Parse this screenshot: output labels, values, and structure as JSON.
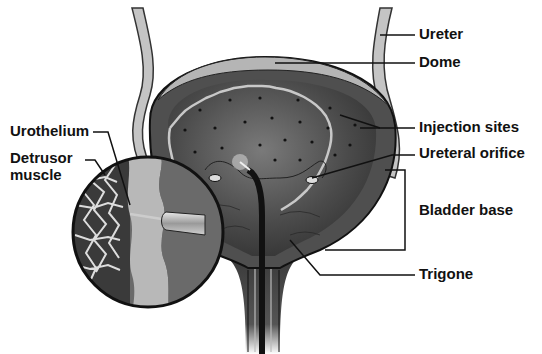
{
  "labels": {
    "ureter": "Ureter",
    "dome": "Dome",
    "injection_sites": "Injection sites",
    "ureteral_orifice": "Ureteral orifice",
    "bladder_base": "Bladder base",
    "trigone": "Trigone",
    "urothelium": "Urothelium",
    "detrusor_line1": "Detrusor",
    "detrusor_line2": "muscle"
  },
  "colors": {
    "background": "#ffffff",
    "bladder_wall": "#5a5a5a",
    "bladder_inner": "#3a3a3a",
    "dome_band": "#b5b5b5",
    "mucosa_line": "#c8c8c8",
    "ureter": "#bdbdbd",
    "leader": "#111111"
  }
}
